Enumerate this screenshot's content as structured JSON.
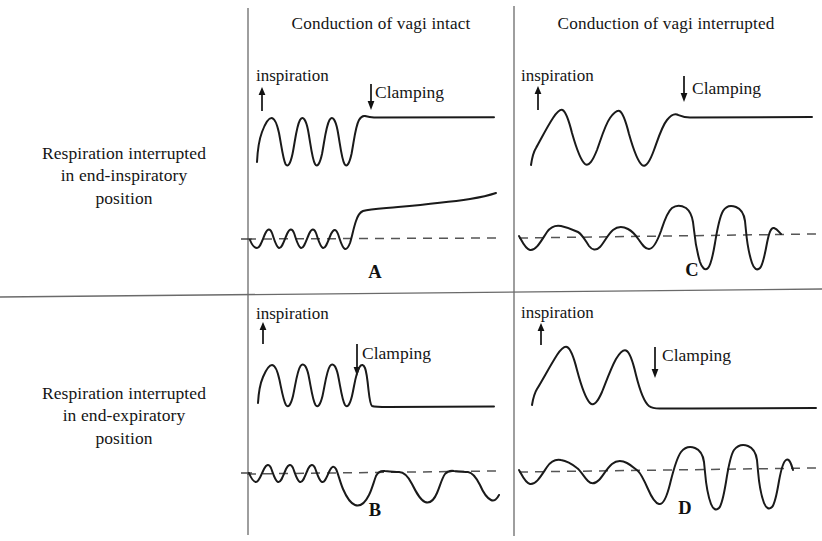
{
  "figure": {
    "title_present": false,
    "background_color": "#ffffff",
    "trace_color": "#1a1a1a",
    "baseline_color": "#555555",
    "divider_color": "#666666"
  },
  "column_headers": [
    {
      "label": "Conduction of vagi intact"
    },
    {
      "label": "Conduction of vagi interrupted"
    }
  ],
  "row_labels": [
    {
      "line1": "Respiration interrupted",
      "line2": "in end-inspiratory",
      "line3": "position"
    },
    {
      "line1": "Respiration interrupted",
      "line2": "in end-expiratory",
      "line3": "position"
    }
  ],
  "panels": [
    {
      "letter": "A",
      "row": "end-inspiratory",
      "column": "vagi intact",
      "inspiration_label": "inspiration",
      "clamping_label": "Clamping",
      "upper_trace": {
        "description": "regular rapid respiratory oscillations then flat line held at inspiratory (upper) level after clamping",
        "cycles_before_clamp": 5,
        "hold_level": "inspiratory-peak"
      },
      "lower_trace": {
        "description": "small oscillations about dashed baseline, then steep rise and slow continued ascent",
        "cycles_before_clamp": 5,
        "after_clamp": "steep rise then slow upward drift",
        "baseline_dashed": true
      }
    },
    {
      "letter": "C",
      "row": "end-inspiratory",
      "column": "vagi interrupted",
      "inspiration_label": "inspiration",
      "clamping_label": "Clamping",
      "upper_trace": {
        "description": "three large slow respiratory excursions then flat line held at inspiratory (upper) level",
        "cycles_before_clamp": 3,
        "hold_level": "inspiratory-peak"
      },
      "lower_trace": {
        "description": "small rounded undulations about dashed baseline, then large square-topped excursions with deep negative troughs",
        "cycles_before_clamp": 3,
        "after_clamp": "large plateaued waves with deep downward spikes",
        "baseline_dashed": true
      }
    },
    {
      "letter": "B",
      "row": "end-expiratory",
      "column": "vagi intact",
      "inspiration_label": "inspiration",
      "clamping_label": "Clamping",
      "upper_trace": {
        "description": "regular rapid respiratory oscillations then flat line held at expiratory (lower) level after clamping",
        "cycles_before_clamp": 5,
        "hold_level": "expiratory-trough"
      },
      "lower_trace": {
        "description": "small oscillations about dashed baseline, then repeated deep downward excursions below baseline",
        "cycles_before_clamp": 4,
        "after_clamp": "three to four deep negative waves returning to baseline",
        "baseline_dashed": true
      }
    },
    {
      "letter": "D",
      "row": "end-expiratory",
      "column": "vagi interrupted",
      "inspiration_label": "inspiration",
      "clamping_label": "Clamping",
      "upper_trace": {
        "description": "two large slow respiratory excursions then flat line held at expiratory (lower) level",
        "cycles_before_clamp": 2,
        "hold_level": "expiratory-trough"
      },
      "lower_trace": {
        "description": "small rounded undulations about dashed baseline, then very large square-topped waves with deep negative troughs",
        "cycles_before_clamp": 3,
        "after_clamp": "three large plateaued waves with deep downward spikes",
        "baseline_dashed": true
      }
    }
  ],
  "annotations": {
    "inspiration_arrow_direction": "up",
    "clamping_arrow_direction": "down"
  }
}
